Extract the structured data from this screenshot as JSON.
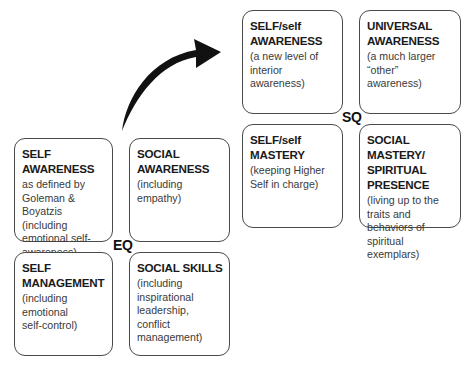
{
  "diagram": {
    "arrow": {
      "direction": "from EQ to SQ",
      "color": "#111111"
    },
    "eq": {
      "label": "EQ",
      "boxes": [
        {
          "title": "SELF AWARENESS",
          "desc": "as defined by\nGoleman &\nBoyatzis (including\nemotional self-\nawareness)"
        },
        {
          "title": "SOCIAL\nAWARENESS",
          "desc": "(including empathy)"
        },
        {
          "title": "SELF\nMANAGEMENT",
          "desc": "(including\nemotional\nself-control)"
        },
        {
          "title": "SOCIAL SKILLS",
          "desc": "(including\ninspirational\nleadership, conflict\nmanagement)"
        }
      ]
    },
    "sq": {
      "label": "SQ",
      "boxes": [
        {
          "title": "SELF/self\nAWARENESS",
          "desc": "(a new level of\ninterior awareness)"
        },
        {
          "title": "UNIVERSAL\nAWARENESS",
          "desc": "(a much larger\n“other” awareness)"
        },
        {
          "title": "SELF/self\nMASTERY",
          "desc": "(keeping Higher\nSelf in charge)"
        },
        {
          "title": "SOCIAL MASTERY/\nSPIRITUAL\nPRESENCE",
          "desc": "(living up to the\ntraits and\nbehaviors of\nspiritual exemplars)"
        }
      ]
    }
  }
}
